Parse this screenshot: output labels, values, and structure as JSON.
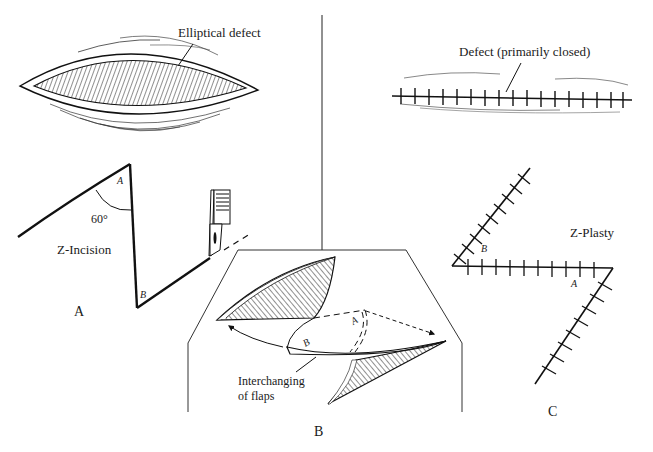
{
  "figure": {
    "panels": [
      {
        "id": "A",
        "letter": "A",
        "labels": {
          "elliptical_defect": "Elliptical defect",
          "angle": "60°",
          "incision": "Z-Incision",
          "point_a": "A",
          "point_b": "B"
        }
      },
      {
        "id": "B",
        "letter": "B",
        "labels": {
          "interchanging_line1": "Interchanging",
          "interchanging_line2": "of flaps",
          "point_a": "A",
          "point_b": "B"
        }
      },
      {
        "id": "C",
        "letter": "C",
        "labels": {
          "defect_closed": "Defect (primarily closed)",
          "plasty": "Z-Plasty",
          "point_a": "A",
          "point_b": "B"
        }
      }
    ],
    "colors": {
      "ink": "#111111",
      "background": "#ffffff"
    }
  }
}
